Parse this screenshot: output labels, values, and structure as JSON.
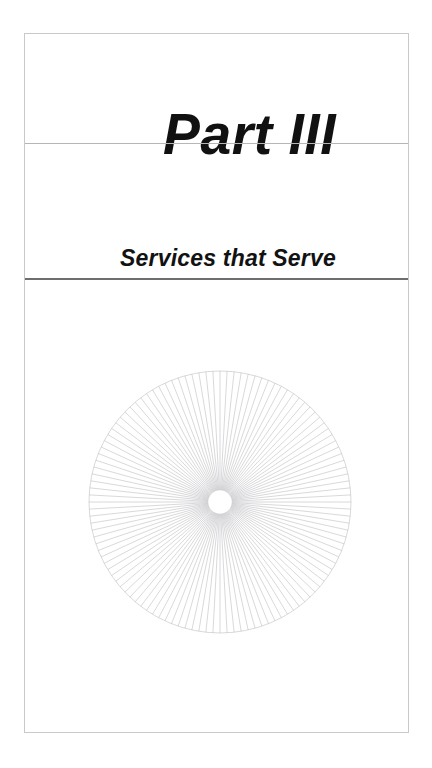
{
  "document": {
    "kind": "book-part-divider-page",
    "background_color": "#ffffff",
    "page_frame": {
      "border_color": "#c9c9c9",
      "fill_color": "#ffffff"
    }
  },
  "part": {
    "title": "Part III",
    "subtitle": "Services that Serve",
    "title_color": "#111111",
    "subtitle_color": "#121212"
  },
  "rules": {
    "title_rule_color": "#b6b6b6",
    "subtitle_rule_color": "#6e6e6e"
  },
  "ornament": {
    "name": "radial-sunburst-ornament",
    "type": "sunburst",
    "spoke_count": 116,
    "spoke_color": "#b9b9be",
    "spoke_width": 0.55,
    "outer_radius": 131,
    "hub_radius": 11,
    "hub_fill": "#ffffff",
    "hub_stroke": "#ffffff",
    "center_x": 133,
    "center_y": 133
  }
}
